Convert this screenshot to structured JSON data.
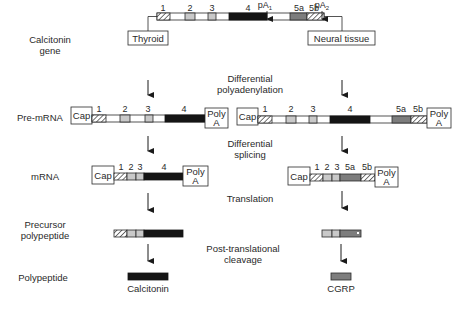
{
  "row_labels": {
    "gene_line1": "Calcitonin",
    "gene_line2": "gene",
    "premrna": "Pre-mRNA",
    "mrna": "mRNA",
    "precursor_line1": "Precursor",
    "precursor_line2": "polypeptide",
    "polypeptide": "Polypeptide"
  },
  "steps": {
    "polyadenylation_line1": "Differential",
    "polyadenylation_line2": "polyadenylation",
    "splicing_line1": "Differential",
    "splicing_line2": "splicing",
    "translation": "Translation",
    "cleavage_line1": "Post-translational",
    "cleavage_line2": "cleavage"
  },
  "gene": {
    "exons": [
      "1",
      "2",
      "3",
      "4",
      "5a",
      "5b"
    ],
    "pa1": "pA",
    "pa1_sub": "1",
    "pa2": "pA",
    "pa2_sub": "2"
  },
  "tissues": {
    "left": "Thyroid",
    "right": "Neural tissue"
  },
  "caps": {
    "cap": "Cap",
    "polya_line1": "Poly",
    "polya_line2": "A"
  },
  "premrna_left_exons": [
    "1",
    "2",
    "3",
    "4"
  ],
  "premrna_right_exons": [
    "1",
    "2",
    "3",
    "4",
    "5a",
    "5b"
  ],
  "mrna_left_exons": [
    "1",
    "2",
    "3",
    "4"
  ],
  "mrna_right_exons": [
    "1",
    "2",
    "3",
    "5a",
    "5b"
  ],
  "products": {
    "left": "Calcitonin",
    "right": "CGRP"
  },
  "colors": {
    "exon4_black": "#151515",
    "exon_light_gray": "#c9c9c9",
    "exon5a_gray": "#7d7d7d",
    "outline": "#2a2a2a"
  }
}
